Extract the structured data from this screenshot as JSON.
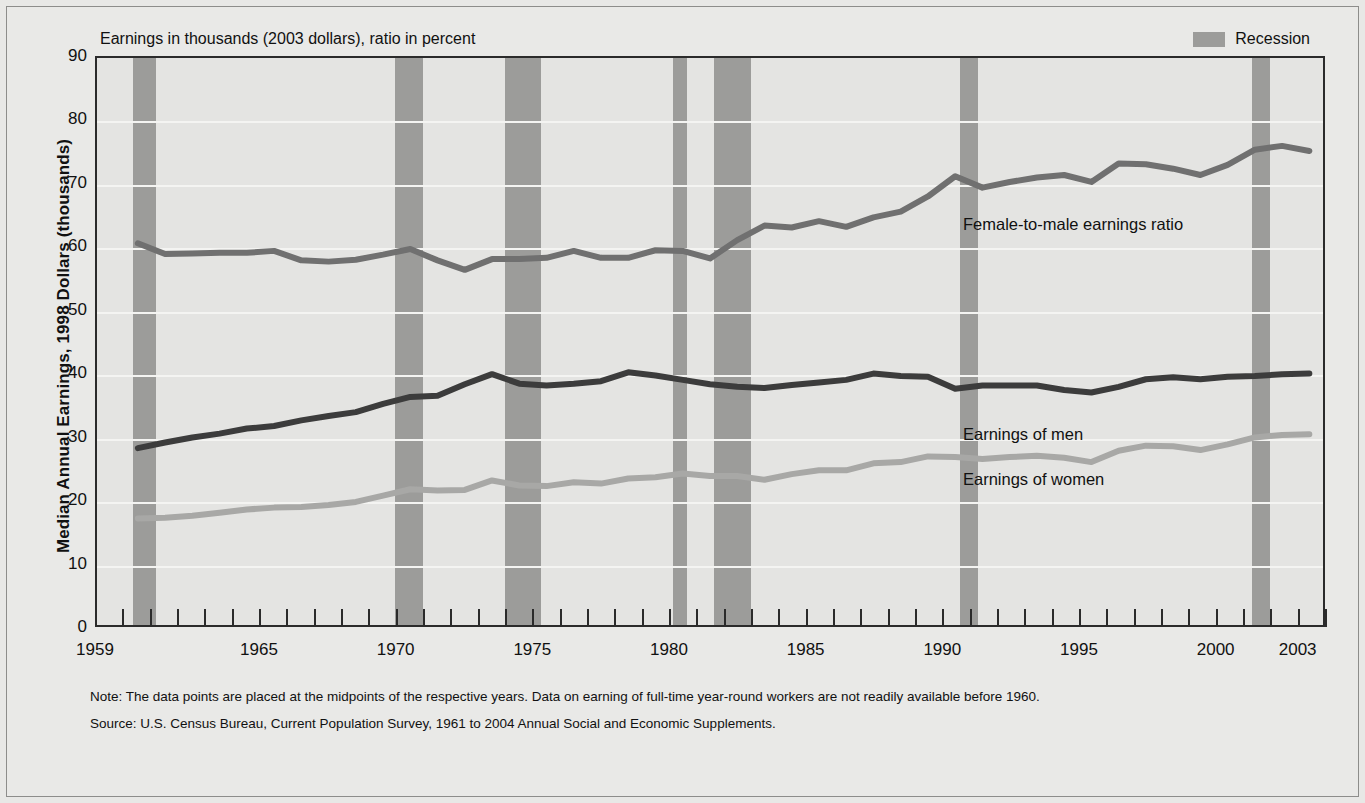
{
  "chart_data": {
    "type": "line",
    "title": "",
    "subtitle": "Earnings in thousands (2003 dollars), ratio in percent",
    "ylabel": "Median Annual Earnings, 1998 Dollars (thousands)",
    "xlabel": "",
    "ylim": [
      0,
      90
    ],
    "xlim": [
      1959,
      2004
    ],
    "grid": true,
    "legend_position": "top-right",
    "y_ticks": [
      0,
      10,
      20,
      30,
      40,
      50,
      60,
      70,
      80,
      90
    ],
    "x_ticks": [
      1959,
      1965,
      1970,
      1975,
      1980,
      1985,
      1990,
      1995,
      2000,
      2003
    ],
    "x_tick_labels": [
      "1959",
      "1965",
      "1970",
      "1975",
      "1980",
      "1985",
      "1990",
      "1995",
      "2000",
      "2003"
    ],
    "x_minor_ticks": [
      1959,
      1960,
      1961,
      1962,
      1963,
      1964,
      1965,
      1966,
      1967,
      1968,
      1969,
      1970,
      1971,
      1972,
      1973,
      1974,
      1975,
      1976,
      1977,
      1978,
      1979,
      1980,
      1981,
      1982,
      1983,
      1984,
      1985,
      1986,
      1987,
      1988,
      1989,
      1990,
      1991,
      1992,
      1993,
      1994,
      1995,
      1996,
      1997,
      1998,
      1999,
      2000,
      2001,
      2002,
      2003,
      2004
    ],
    "years": [
      1960,
      1961,
      1962,
      1963,
      1964,
      1965,
      1966,
      1967,
      1968,
      1969,
      1970,
      1971,
      1972,
      1973,
      1974,
      1975,
      1976,
      1977,
      1978,
      1979,
      1980,
      1981,
      1982,
      1983,
      1984,
      1985,
      1986,
      1987,
      1988,
      1989,
      1990,
      1991,
      1992,
      1993,
      1994,
      1995,
      1996,
      1997,
      1998,
      1999,
      2000,
      2001,
      2002,
      2003
    ],
    "series": [
      {
        "name": "Female-to-male earnings ratio",
        "color": "#707070",
        "unit": "percent",
        "values": [
          60.7,
          59.0,
          59.1,
          59.2,
          59.2,
          59.5,
          58.0,
          57.8,
          58.1,
          58.9,
          59.8,
          58.0,
          56.5,
          58.2,
          58.2,
          58.4,
          59.5,
          58.4,
          58.4,
          59.6,
          59.5,
          58.3,
          61.2,
          63.5,
          63.2,
          64.2,
          63.3,
          64.8,
          65.7,
          68.1,
          71.3,
          69.5,
          70.4,
          71.1,
          71.5,
          70.4,
          73.3,
          73.2,
          72.5,
          71.5,
          73.1,
          75.5,
          76.1,
          75.3
        ]
      },
      {
        "name": "Earnings of men",
        "color": "#3c3c3c",
        "unit": "thousands of 2003 dollars",
        "values": [
          28.3,
          29.2,
          30.0,
          30.6,
          31.4,
          31.8,
          32.7,
          33.4,
          34.0,
          35.3,
          36.4,
          36.6,
          38.4,
          40.0,
          38.5,
          38.2,
          38.5,
          38.9,
          40.3,
          39.8,
          39.1,
          38.4,
          38.0,
          37.8,
          38.3,
          38.7,
          39.1,
          40.1,
          39.7,
          39.6,
          37.7,
          38.2,
          38.2,
          38.2,
          37.5,
          37.1,
          38.0,
          39.2,
          39.5,
          39.2,
          39.6,
          39.7,
          40.0,
          40.1
        ]
      },
      {
        "name": "Earnings of women",
        "color": "#a8a8a6",
        "unit": "thousands of 2003 dollars",
        "values": [
          17.2,
          17.3,
          17.6,
          18.1,
          18.6,
          18.9,
          19.0,
          19.3,
          19.8,
          20.8,
          21.8,
          21.6,
          21.7,
          23.2,
          22.4,
          22.3,
          22.9,
          22.7,
          23.5,
          23.7,
          24.3,
          23.9,
          23.9,
          23.3,
          24.2,
          24.8,
          24.8,
          25.9,
          26.1,
          27.0,
          26.9,
          26.6,
          26.9,
          27.1,
          26.8,
          26.1,
          27.9,
          28.7,
          28.6,
          28.0,
          28.9,
          30.0,
          30.4,
          30.5
        ]
      }
    ],
    "recessions": [
      {
        "start": 1960.33,
        "end": 1961.17
      },
      {
        "start": 1969.92,
        "end": 1970.92
      },
      {
        "start": 1973.92,
        "end": 1975.25
      },
      {
        "start": 1980.08,
        "end": 1980.58
      },
      {
        "start": 1981.58,
        "end": 1982.92
      },
      {
        "start": 1990.58,
        "end": 1991.25
      },
      {
        "start": 2001.25,
        "end": 2001.92
      }
    ],
    "annotations": [
      {
        "text": "Female-to-male earnings ratio",
        "x_px": 963,
        "y_px": 215
      },
      {
        "text": "Earnings of men",
        "x_px": 963,
        "y_px": 425
      },
      {
        "text": "Earnings of women",
        "x_px": 963,
        "y_px": 470
      }
    ]
  },
  "legend": {
    "swatch_color": "#9c9c9a",
    "label": "Recession"
  },
  "footnotes": [
    "Note: The data points are placed at the midpoints of the respective years. Data on earning of full-time year-round workers are not readily available before 1960.",
    "Source: U.S. Census Bureau, Current Population Survey, 1961 to 2004 Annual Social and Economic Supplements."
  ],
  "colors": {
    "background": "#e8e8e6",
    "plot_background": "#e4e4e2",
    "axis": "#2b2b2b",
    "gridline": "#f4f4f2",
    "recession": "#9c9c9a",
    "ratio_line": "#707070",
    "men_line": "#3c3c3c",
    "women_line": "#a8a8a6"
  }
}
